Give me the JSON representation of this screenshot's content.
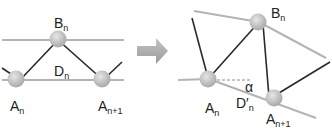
{
  "colors": {
    "background": "#ffffff",
    "grey_line": "#b4b4b4",
    "dark_line": "#2a2a2a",
    "node_fill": "#c2c2c2",
    "node_highlight": "#e6e6e6",
    "arrow_fill": "#a8a8a8",
    "text": "#222222"
  },
  "left_diagram": {
    "nodes": [
      {
        "id": "A_n",
        "cx": 20,
        "cy": 80
      },
      {
        "id": "B_n",
        "cx": 58,
        "cy": 40
      },
      {
        "id": "A_n+1",
        "cx": 103,
        "cy": 80
      }
    ],
    "labels": {
      "b": {
        "main": "B",
        "sub": "n"
      },
      "d": {
        "main": "D",
        "sub": "n"
      },
      "a": {
        "main": "A",
        "sub": "n"
      },
      "a1": {
        "main": "A",
        "sub": "n+1"
      }
    }
  },
  "arrow": {
    "icon": "right-arrow-icon"
  },
  "right_diagram": {
    "nodes": [
      {
        "id": "A_n",
        "cx": 209,
        "cy": 79
      },
      {
        "id": "B_n",
        "cx": 259,
        "cy": 22
      },
      {
        "id": "A_n+1",
        "cx": 275,
        "cy": 98
      }
    ],
    "labels": {
      "b": {
        "main": "B",
        "sub": "n"
      },
      "alpha": "α",
      "d": {
        "main": "D′",
        "sub": "n"
      },
      "a": {
        "main": "A",
        "sub": "n"
      },
      "a1": {
        "main": "A",
        "sub": "n+1"
      }
    }
  }
}
